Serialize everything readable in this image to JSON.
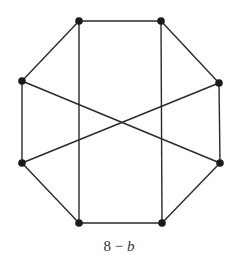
{
  "diagram": {
    "type": "graph",
    "caption": {
      "number": "8",
      "separator": "−",
      "variable": "b"
    },
    "style": {
      "edge_color": "#2a2a2a",
      "node_color": "#1a1a1a",
      "edge_width": 1.4,
      "node_radius": 3.8
    },
    "nodes": [
      {
        "id": "top-left",
        "x": 79,
        "y": 21
      },
      {
        "id": "top-right",
        "x": 161,
        "y": 21
      },
      {
        "id": "right-upper",
        "x": 219,
        "y": 83
      },
      {
        "id": "right-lower",
        "x": 220,
        "y": 163
      },
      {
        "id": "bottom-right",
        "x": 162,
        "y": 223
      },
      {
        "id": "bottom-left",
        "x": 79,
        "y": 223
      },
      {
        "id": "left-lower",
        "x": 22,
        "y": 163
      },
      {
        "id": "left-upper",
        "x": 22,
        "y": 81
      }
    ],
    "edges": [
      [
        "top-left",
        "top-right"
      ],
      [
        "top-right",
        "right-upper"
      ],
      [
        "right-upper",
        "right-lower"
      ],
      [
        "right-lower",
        "bottom-right"
      ],
      [
        "bottom-right",
        "bottom-left"
      ],
      [
        "bottom-left",
        "left-lower"
      ],
      [
        "left-lower",
        "left-upper"
      ],
      [
        "left-upper",
        "top-left"
      ],
      [
        "top-left",
        "bottom-left"
      ],
      [
        "top-right",
        "bottom-right"
      ],
      [
        "left-upper",
        "right-lower"
      ],
      [
        "right-upper",
        "left-lower"
      ]
    ]
  }
}
